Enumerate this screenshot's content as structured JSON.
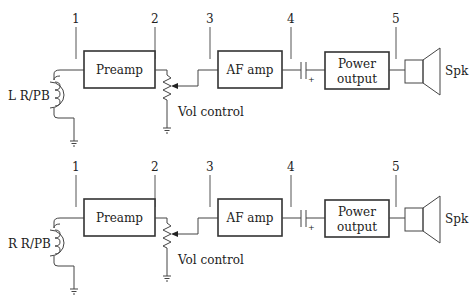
{
  "diagram": {
    "type": "block-diagram",
    "test_points": [
      "1",
      "2",
      "3",
      "4",
      "5"
    ],
    "blocks": {
      "preamp": "Preamp",
      "af_amp": "AF amp",
      "power_output_line1": "Power",
      "power_output_line2": "output",
      "vol_control": "Vol control",
      "speaker": "Spk",
      "cap_polarity": "+"
    },
    "channels": [
      {
        "id": "left",
        "head_label": "L R/PB"
      },
      {
        "id": "right",
        "head_label": "R R/PB"
      }
    ]
  }
}
